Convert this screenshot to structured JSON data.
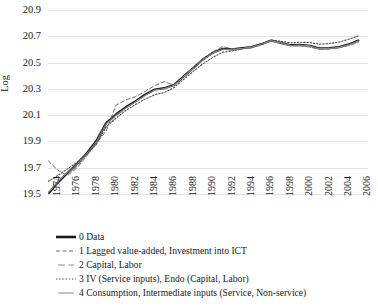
{
  "chart_data": {
    "type": "line",
    "title": "",
    "xlabel": "",
    "ylabel": "Log",
    "ylim": [
      19.5,
      20.9
    ],
    "ytick_step": 0.2,
    "xlim": [
      1974,
      2007
    ],
    "grid": true,
    "legend_position": "below",
    "yticks": [
      "20.9",
      "20.7",
      "20.5",
      "20.3",
      "20.1",
      "19.9",
      "19.7",
      "19.5"
    ],
    "ytick_values": [
      20.9,
      20.7,
      20.5,
      20.3,
      20.1,
      19.9,
      19.7,
      19.5
    ],
    "xticks": [
      "1974",
      "1976",
      "1978",
      "1980",
      "1982",
      "1984",
      "1986",
      "1988",
      "1990",
      "1992",
      "1994",
      "1996",
      "1998",
      "2000",
      "2002",
      "2004",
      "2006"
    ],
    "xtick_values": [
      1974,
      1976,
      1978,
      1980,
      1982,
      1984,
      1986,
      1988,
      1990,
      1992,
      1994,
      1996,
      1998,
      2000,
      2002,
      2004,
      2006
    ],
    "x": [
      1974,
      1975,
      1976,
      1977,
      1978,
      1979,
      1980,
      1981,
      1982,
      1983,
      1984,
      1985,
      1986,
      1987,
      1988,
      1989,
      1990,
      1991,
      1992,
      1993,
      1994,
      1995,
      1996,
      1997,
      1998,
      1999,
      2000,
      2001,
      2002,
      2003,
      2004,
      2005,
      2006
    ],
    "series": [
      {
        "name": "0 Data",
        "style": "solid-thick",
        "color": "#1a1a1a",
        "width": 2.2,
        "values": [
          19.5,
          19.585,
          19.66,
          19.73,
          19.81,
          19.905,
          20.04,
          20.105,
          20.16,
          20.205,
          20.255,
          20.295,
          20.305,
          20.33,
          20.395,
          20.46,
          20.525,
          20.575,
          20.605,
          20.6,
          20.61,
          20.618,
          20.64,
          20.668,
          20.65,
          20.632,
          20.635,
          20.628,
          20.608,
          20.61,
          20.618,
          20.638,
          20.668
        ]
      },
      {
        "name": "1 Lagged value-added, Investment into ICT",
        "style": "dashed",
        "color": "#6e6e6e",
        "width": 1.0,
        "values": [
          19.755,
          19.682,
          19.64,
          19.7,
          19.79,
          19.89,
          19.98,
          20.175,
          20.215,
          20.24,
          20.28,
          20.325,
          20.355,
          20.328,
          20.395,
          20.47,
          20.53,
          20.58,
          20.622,
          20.605,
          20.606,
          20.612,
          20.638,
          20.668,
          20.655,
          20.628,
          20.628,
          20.618,
          20.6,
          20.604,
          20.612,
          20.63,
          20.652
        ]
      },
      {
        "name": "2 Capital, Labor",
        "style": "longdash",
        "color": "#8a8a8a",
        "width": 1.0,
        "values": [
          19.512,
          19.575,
          19.648,
          19.712,
          19.795,
          19.88,
          20.01,
          20.09,
          20.15,
          20.2,
          20.25,
          20.29,
          20.3,
          20.325,
          20.392,
          20.455,
          20.52,
          20.572,
          20.6,
          20.596,
          20.606,
          20.615,
          20.638,
          20.665,
          20.648,
          20.63,
          20.632,
          20.624,
          20.604,
          20.606,
          20.614,
          20.634,
          20.662
        ]
      },
      {
        "name": "3 IV (Service inputs), Endo (Capital, Labor)",
        "style": "dotted",
        "color": "#4d4d4d",
        "width": 1.1,
        "values": [
          19.595,
          19.64,
          19.69,
          19.742,
          19.8,
          19.88,
          20.012,
          20.075,
          20.135,
          20.18,
          20.222,
          20.255,
          20.272,
          20.31,
          20.372,
          20.435,
          20.492,
          20.54,
          20.578,
          20.588,
          20.604,
          20.618,
          20.645,
          20.672,
          20.662,
          20.65,
          20.655,
          20.652,
          20.64,
          20.645,
          20.655,
          20.678,
          20.702
        ]
      },
      {
        "name": "4 Consumption, Intermediate inputs (Service, Non-service)",
        "style": "solid-thin",
        "color": "#8a8a8a",
        "width": 1.0,
        "values": [
          19.505,
          19.59,
          19.662,
          19.728,
          19.808,
          19.9,
          20.035,
          20.1,
          20.155,
          20.2,
          20.25,
          20.292,
          20.302,
          20.328,
          20.392,
          20.458,
          20.522,
          20.572,
          20.602,
          20.598,
          20.608,
          20.616,
          20.638,
          20.666,
          20.648,
          20.63,
          20.632,
          20.626,
          20.606,
          20.608,
          20.616,
          20.636,
          20.664
        ]
      }
    ]
  },
  "legend": {
    "items": [
      {
        "label": "0 Data"
      },
      {
        "label": "1 Lagged value-added, Investment into ICT"
      },
      {
        "label": "2 Capital, Labor"
      },
      {
        "label": "3 IV (Service inputs), Endo (Capital, Labor)"
      },
      {
        "label": "4 Consumption, Intermediate inputs (Service, Non-service)"
      }
    ]
  }
}
